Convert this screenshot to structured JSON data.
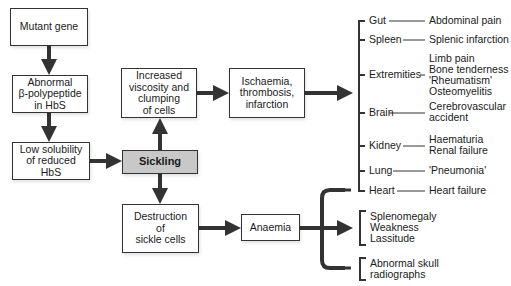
{
  "nodes": {
    "mutant_gene": "Mutant gene",
    "abnormal_polypeptide": "Abnormal\nβ-polypeptide\nin HbS",
    "low_solubility": "Low solubility\nof reduced\nHbS",
    "sickling": "Sickling",
    "increased_viscosity": "Increased\nviscosity and\nclumping\nof cells",
    "ischaemia": "Ischaemia,\nthrombosis,\ninfarction",
    "destruction": "Destruction\nof\nsickle cells",
    "anaemia": "Anaemia"
  },
  "organs": [
    {
      "organ": "Gut",
      "effect": "Abdominal pain"
    },
    {
      "organ": "Spleen",
      "effect": "Splenic infarction"
    },
    {
      "organ": "Extremities",
      "effect": "Limb pain\nBone tenderness\n'Rheumatism'\nOsteomyelitis"
    },
    {
      "organ": "Brain",
      "effect": "Cerebrovascular\naccident"
    },
    {
      "organ": "Kidney",
      "effect": "Haematuria\nRenal failure"
    },
    {
      "organ": "Lung",
      "effect": "'Pneumonia'"
    },
    {
      "organ": "Heart",
      "effect": "Heart failure"
    }
  ],
  "anaemia_effects": {
    "group1": "Splenomegaly\nWeakness\nLassitude",
    "group2": "Abnormal skull\nradiographs"
  },
  "colors": {
    "line": "#333333",
    "sickling_fill": "#c8c8c8"
  }
}
